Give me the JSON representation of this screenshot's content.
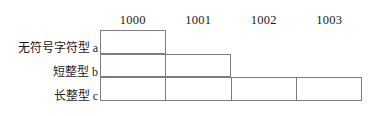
{
  "diagram": {
    "type": "memory-layout-table",
    "address_headers": [
      "1000",
      "1001",
      "1002",
      "1003"
    ],
    "rows": [
      {
        "label": "无符号字符型 a",
        "variable": "a",
        "bytes": 1,
        "start_address": "1000"
      },
      {
        "label": "短整型 b",
        "variable": "b",
        "bytes": 2,
        "start_address": "1000"
      },
      {
        "label": "长整型 c",
        "variable": "c",
        "bytes": 4,
        "start_address": "1000"
      }
    ],
    "colors": {
      "border": "#7d7d7d",
      "background": "#ffffff",
      "text": "#1b1b1b"
    }
  }
}
